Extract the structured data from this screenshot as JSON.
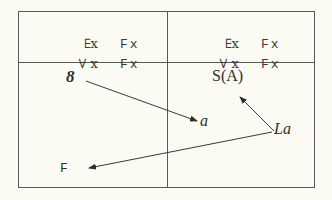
{
  "diagram": {
    "top_left": {
      "rows": [
        {
          "quantifier": "∃",
          "variable": "x",
          "predicate": "Fx"
        },
        {
          "quantifier": "∀",
          "variable": "x",
          "predicate": "Fx"
        }
      ]
    },
    "top_right": {
      "rows": [
        {
          "quantifier": "∃",
          "variable": "x",
          "predicate": "Fx"
        },
        {
          "quantifier": "∀",
          "variable": "x",
          "predicate": "Fx"
        }
      ]
    },
    "bottom_left": {
      "symbol": "8",
      "predicate": "F"
    },
    "bottom_right": {
      "term": "S(A)",
      "constant": "a",
      "relation": "La"
    },
    "arrows": [
      {
        "from": "8",
        "to": "a"
      },
      {
        "from": "La",
        "to": "S(A)"
      },
      {
        "from": "La",
        "to": "F"
      }
    ],
    "colors": {
      "background": "#fbfbf4",
      "line": "#5a5a55",
      "text": "#2e2e2a"
    }
  }
}
